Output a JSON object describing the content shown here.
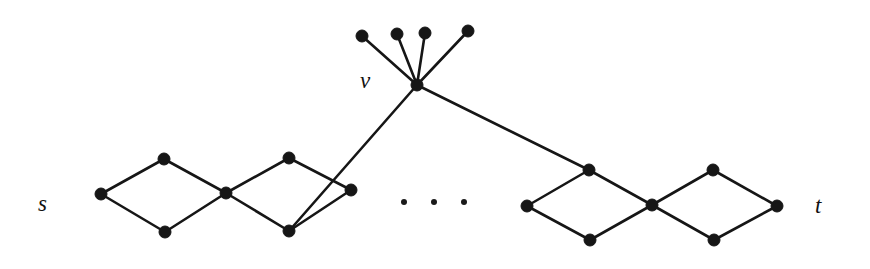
{
  "figure": {
    "background_color": "#ffffff",
    "edge_color": "#161616",
    "vertex_color": "#161616",
    "width": 870,
    "height": 269
  },
  "labels": {
    "source": "s",
    "sink": "t",
    "star_center": "v"
  },
  "chart_data": {
    "type": "diagram",
    "graph_type": "undirected",
    "node_radius": 6.0,
    "ellipsis_dot_radius": 3.0,
    "nodes": [
      {
        "id": "s",
        "x": 101,
        "y": 194,
        "label": "s",
        "label_pos": "left"
      },
      {
        "id": "a1",
        "x": 164,
        "y": 159,
        "label": "",
        "label_pos": ""
      },
      {
        "id": "b1",
        "x": 165,
        "y": 232,
        "label": "",
        "label_pos": ""
      },
      {
        "id": "c1",
        "x": 226,
        "y": 193,
        "label": "",
        "label_pos": ""
      },
      {
        "id": "a2",
        "x": 289,
        "y": 158,
        "label": "",
        "label_pos": ""
      },
      {
        "id": "b2",
        "x": 289,
        "y": 231,
        "label": "",
        "label_pos": ""
      },
      {
        "id": "c2",
        "x": 351,
        "y": 190,
        "label": "",
        "label_pos": ""
      },
      {
        "id": "a3",
        "x": 589,
        "y": 170,
        "label": "",
        "label_pos": ""
      },
      {
        "id": "c3",
        "x": 527,
        "y": 206,
        "label": "",
        "label_pos": ""
      },
      {
        "id": "b3",
        "x": 590,
        "y": 240,
        "label": "",
        "label_pos": ""
      },
      {
        "id": "c4",
        "x": 652,
        "y": 205,
        "label": "",
        "label_pos": ""
      },
      {
        "id": "a4",
        "x": 713,
        "y": 170,
        "label": "",
        "label_pos": ""
      },
      {
        "id": "b4",
        "x": 714,
        "y": 240,
        "label": "",
        "label_pos": ""
      },
      {
        "id": "t",
        "x": 777,
        "y": 206,
        "label": "t",
        "label_pos": "right"
      },
      {
        "id": "v",
        "x": 417,
        "y": 85,
        "label": "v",
        "label_pos": "left"
      },
      {
        "id": "p1",
        "x": 362,
        "y": 36,
        "label": "",
        "label_pos": ""
      },
      {
        "id": "p2",
        "x": 397,
        "y": 34,
        "label": "",
        "label_pos": ""
      },
      {
        "id": "p3",
        "x": 425,
        "y": 33,
        "label": "",
        "label_pos": ""
      },
      {
        "id": "p4",
        "x": 468,
        "y": 31,
        "label": "",
        "label_pos": ""
      }
    ],
    "edges": [
      {
        "from": "s",
        "to": "a1"
      },
      {
        "from": "s",
        "to": "b1"
      },
      {
        "from": "a1",
        "to": "c1"
      },
      {
        "from": "b1",
        "to": "c1"
      },
      {
        "from": "c1",
        "to": "a2"
      },
      {
        "from": "c1",
        "to": "b2"
      },
      {
        "from": "a2",
        "to": "c2"
      },
      {
        "from": "b2",
        "to": "c2"
      },
      {
        "from": "c3",
        "to": "a3"
      },
      {
        "from": "c3",
        "to": "b3"
      },
      {
        "from": "a3",
        "to": "c4"
      },
      {
        "from": "b3",
        "to": "c4"
      },
      {
        "from": "c4",
        "to": "a4"
      },
      {
        "from": "c4",
        "to": "b4"
      },
      {
        "from": "a4",
        "to": "t"
      },
      {
        "from": "b4",
        "to": "t"
      },
      {
        "from": "v",
        "to": "b2"
      },
      {
        "from": "v",
        "to": "a3"
      },
      {
        "from": "v",
        "to": "p1"
      },
      {
        "from": "v",
        "to": "p2"
      },
      {
        "from": "v",
        "to": "p3"
      },
      {
        "from": "v",
        "to": "p4"
      }
    ],
    "ellipsis_dots": [
      {
        "x": 404,
        "y": 202
      },
      {
        "x": 434,
        "y": 202
      },
      {
        "x": 464,
        "y": 202
      }
    ],
    "annotations": [
      {
        "text": "s",
        "x": 45,
        "y": 205
      },
      {
        "text": "t",
        "x": 822,
        "y": 207
      },
      {
        "text": "v",
        "x": 368,
        "y": 82
      }
    ]
  }
}
